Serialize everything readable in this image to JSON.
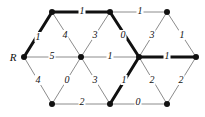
{
  "figure": {
    "width": 205,
    "height": 117,
    "background": "#ffffff"
  },
  "style": {
    "node_color": "#111111",
    "node_radius": 3,
    "edge_color_normal": "#8c8c8c",
    "edge_color_bold": "#111111",
    "edge_width_normal": 1,
    "edge_width_bold": 3,
    "label_color": "#111111"
  },
  "nodes": [
    {
      "id": "R",
      "label": "R",
      "label_x": 13,
      "label_y": 57,
      "x": 24,
      "y": 57
    },
    {
      "id": "T1",
      "label": "",
      "label_x": 0,
      "label_y": 0,
      "x": 52,
      "y": 12
    },
    {
      "id": "T2",
      "label": "",
      "label_x": 0,
      "label_y": 0,
      "x": 110,
      "y": 12
    },
    {
      "id": "T3",
      "label": "",
      "label_x": 0,
      "label_y": 0,
      "x": 167,
      "y": 12
    },
    {
      "id": "M1",
      "label": "",
      "label_x": 0,
      "label_y": 0,
      "x": 81,
      "y": 57
    },
    {
      "id": "M2",
      "label": "",
      "label_x": 0,
      "label_y": 0,
      "x": 139,
      "y": 57
    },
    {
      "id": "M3",
      "label": "",
      "label_x": 0,
      "label_y": 0,
      "x": 196,
      "y": 57
    },
    {
      "id": "B1",
      "label": "",
      "label_x": 0,
      "label_y": 0,
      "x": 52,
      "y": 104
    },
    {
      "id": "B2",
      "label": "",
      "label_x": 0,
      "label_y": 0,
      "x": 110,
      "y": 104
    },
    {
      "id": "B3",
      "label": "",
      "label_x": 0,
      "label_y": 0,
      "x": 167,
      "y": 104
    }
  ],
  "edges": [
    {
      "id": "e-R-T1",
      "from": "R",
      "to": "T1",
      "weight": "1",
      "bold": true,
      "lx": 38,
      "ly": 37
    },
    {
      "id": "e-T1-T2",
      "from": "T1",
      "to": "T2",
      "weight": "1",
      "bold": true,
      "lx": 82,
      "ly": 11
    },
    {
      "id": "e-T2-T3",
      "from": "T2",
      "to": "T3",
      "weight": "1",
      "bold": false,
      "lx": 140,
      "ly": 11
    },
    {
      "id": "e-T1-M1",
      "from": "T1",
      "to": "M1",
      "weight": "4",
      "bold": false,
      "lx": 65,
      "ly": 35
    },
    {
      "id": "e-T2-M1",
      "from": "T2",
      "to": "M1",
      "weight": "3",
      "bold": false,
      "lx": 95,
      "ly": 35
    },
    {
      "id": "e-T2-M2",
      "from": "T2",
      "to": "M2",
      "weight": "0",
      "bold": true,
      "lx": 123,
      "ly": 35
    },
    {
      "id": "e-T3-M2",
      "from": "T3",
      "to": "M2",
      "weight": "3",
      "bold": false,
      "lx": 152,
      "ly": 35
    },
    {
      "id": "e-T3-M3",
      "from": "T3",
      "to": "M3",
      "weight": "1",
      "bold": false,
      "lx": 182,
      "ly": 35
    },
    {
      "id": "e-R-M1",
      "from": "R",
      "to": "M1",
      "weight": "5",
      "bold": false,
      "lx": 52,
      "ly": 56
    },
    {
      "id": "e-M1-M2",
      "from": "M1",
      "to": "M2",
      "weight": "1",
      "bold": false,
      "lx": 110,
      "ly": 56
    },
    {
      "id": "e-M2-M3",
      "from": "M2",
      "to": "M3",
      "weight": "1",
      "bold": true,
      "lx": 167,
      "ly": 56
    },
    {
      "id": "e-R-B1",
      "from": "R",
      "to": "B1",
      "weight": "4",
      "bold": false,
      "lx": 38,
      "ly": 80
    },
    {
      "id": "e-M1-B1",
      "from": "M1",
      "to": "B1",
      "weight": "0",
      "bold": false,
      "lx": 67,
      "ly": 80
    },
    {
      "id": "e-M1-B2",
      "from": "M1",
      "to": "B2",
      "weight": "3",
      "bold": false,
      "lx": 95,
      "ly": 80
    },
    {
      "id": "e-M2-B2",
      "from": "M2",
      "to": "B2",
      "weight": "1",
      "bold": true,
      "lx": 124,
      "ly": 80
    },
    {
      "id": "e-M2-B3",
      "from": "M2",
      "to": "B3",
      "weight": "2",
      "bold": false,
      "lx": 152,
      "ly": 80
    },
    {
      "id": "e-M3-B3",
      "from": "M3",
      "to": "B3",
      "weight": "2",
      "bold": false,
      "lx": 181,
      "ly": 80
    },
    {
      "id": "e-B1-B2",
      "from": "B1",
      "to": "B2",
      "weight": "2",
      "bold": false,
      "lx": 82,
      "ly": 102
    },
    {
      "id": "e-B2-B3",
      "from": "B2",
      "to": "B3",
      "weight": "0",
      "bold": false,
      "lx": 138,
      "ly": 102
    }
  ]
}
